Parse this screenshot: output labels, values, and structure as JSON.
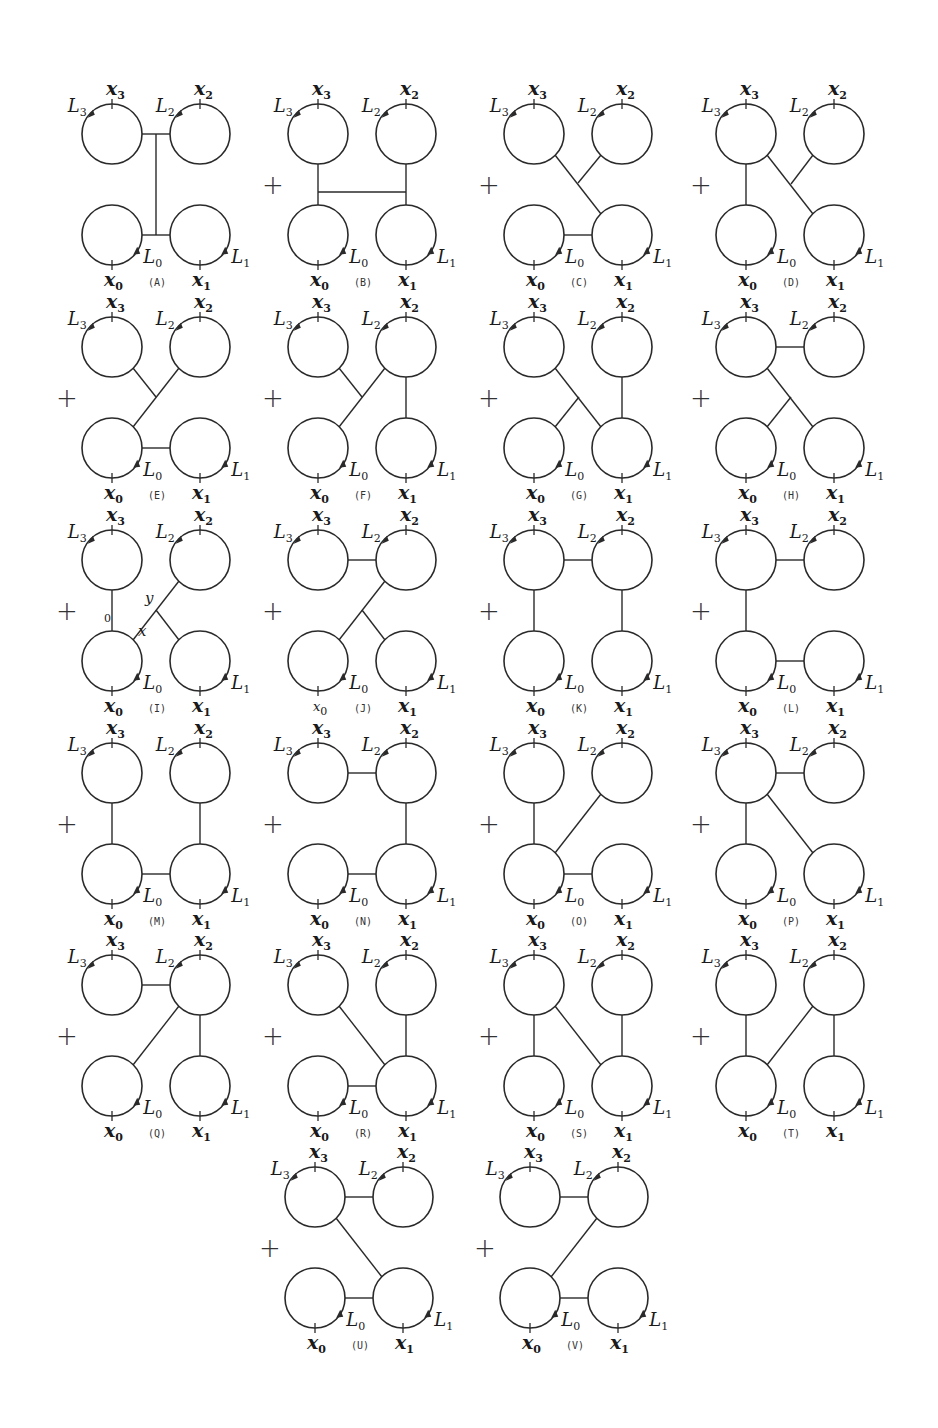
{
  "figure": {
    "circle_labels": {
      "top_left": {
        "point": "x",
        "point_sub": "3",
        "loop": "L",
        "loop_sub": "3"
      },
      "top_right": {
        "point": "x",
        "point_sub": "2",
        "loop": "L",
        "loop_sub": "2"
      },
      "bottom_left": {
        "point": "x",
        "point_sub": "0",
        "loop": "L",
        "loop_sub": "0"
      },
      "bottom_right": {
        "point": "x",
        "point_sub": "1",
        "loop": "L",
        "loop_sub": "1"
      }
    },
    "operator": "+",
    "geometry": {
      "radius": 30,
      "dx": 88,
      "dy": 101
    },
    "panels": [
      {
        "id": "(A)",
        "col": 0,
        "row": 0,
        "plus": false,
        "edges": [
          [
            [
              30,
              0
            ],
            [
              58,
              0
            ]
          ],
          [
            [
              30,
              101
            ],
            [
              58,
              101
            ]
          ],
          [
            [
              44,
              0
            ],
            [
              44,
              101
            ]
          ]
        ]
      },
      {
        "id": "(B)",
        "col": 1,
        "row": 0,
        "plus": true,
        "edges": [
          [
            [
              0,
              30
            ],
            [
              0,
              71
            ]
          ],
          [
            [
              88,
              30
            ],
            [
              88,
              71
            ]
          ],
          [
            [
              0,
              58
            ],
            [
              88,
              58
            ]
          ]
        ]
      },
      {
        "id": "(C)",
        "col": 2,
        "row": 0,
        "plus": true,
        "edges": [
          [
            [
              30,
              101
            ],
            [
              58,
              101
            ]
          ],
          [
            [
              21,
              21
            ],
            [
              67,
              80
            ]
          ],
          [
            [
              67,
              21
            ],
            [
              44,
              49
            ]
          ]
        ]
      },
      {
        "id": "(D)",
        "col": 3,
        "row": 0,
        "plus": true,
        "edges": [
          [
            [
              0,
              30
            ],
            [
              0,
              71
            ]
          ],
          [
            [
              21,
              21
            ],
            [
              67,
              80
            ]
          ],
          [
            [
              67,
              21
            ],
            [
              45,
              50
            ]
          ]
        ]
      },
      {
        "id": "(E)",
        "col": 0,
        "row": 1,
        "plus": true,
        "edges": [
          [
            [
              30,
              101
            ],
            [
              58,
              101
            ]
          ],
          [
            [
              21,
              80
            ],
            [
              67,
              21
            ]
          ],
          [
            [
              21,
              21
            ],
            [
              44,
              50
            ]
          ]
        ]
      },
      {
        "id": "(F)",
        "col": 1,
        "row": 1,
        "plus": true,
        "edges": [
          [
            [
              88,
              30
            ],
            [
              88,
              71
            ]
          ],
          [
            [
              21,
              80
            ],
            [
              67,
              21
            ]
          ],
          [
            [
              21,
              21
            ],
            [
              44,
              50
            ]
          ]
        ]
      },
      {
        "id": "(G)",
        "col": 2,
        "row": 1,
        "plus": true,
        "edges": [
          [
            [
              88,
              30
            ],
            [
              88,
              71
            ]
          ],
          [
            [
              21,
              21
            ],
            [
              67,
              80
            ]
          ],
          [
            [
              21,
              80
            ],
            [
              45,
              50
            ]
          ]
        ]
      },
      {
        "id": "(H)",
        "col": 3,
        "row": 1,
        "plus": true,
        "edges": [
          [
            [
              30,
              0
            ],
            [
              58,
              0
            ]
          ],
          [
            [
              21,
              21
            ],
            [
              67,
              80
            ]
          ],
          [
            [
              21,
              80
            ],
            [
              45,
              50
            ]
          ]
        ]
      },
      {
        "id": "(I)",
        "col": 0,
        "row": 2,
        "plus": true,
        "edges": [
          [
            [
              0,
              30
            ],
            [
              0,
              71
            ]
          ],
          [
            [
              21,
              80
            ],
            [
              67,
              21
            ]
          ],
          [
            [
              44,
              50
            ],
            [
              67,
              80
            ]
          ]
        ],
        "annotations": [
          {
            "text": "y",
            "x": 33,
            "y": 43
          },
          {
            "text": "x",
            "x": 26,
            "y": 76
          },
          {
            "text": "0",
            "x": -8,
            "y": 62,
            "small": true
          }
        ]
      },
      {
        "id": "(J)",
        "col": 1,
        "row": 2,
        "plus": true,
        "edges": [
          [
            [
              30,
              0
            ],
            [
              58,
              0
            ]
          ],
          [
            [
              21,
              80
            ],
            [
              67,
              21
            ]
          ],
          [
            [
              44,
              50
            ],
            [
              67,
              80
            ]
          ]
        ],
        "x0_small": true
      },
      {
        "id": "(K)",
        "col": 2,
        "row": 2,
        "plus": true,
        "edges": [
          [
            [
              30,
              0
            ],
            [
              58,
              0
            ]
          ],
          [
            [
              0,
              30
            ],
            [
              0,
              71
            ]
          ],
          [
            [
              88,
              30
            ],
            [
              88,
              71
            ]
          ]
        ]
      },
      {
        "id": "(L)",
        "col": 3,
        "row": 2,
        "plus": true,
        "edges": [
          [
            [
              30,
              0
            ],
            [
              58,
              0
            ]
          ],
          [
            [
              0,
              30
            ],
            [
              0,
              71
            ]
          ],
          [
            [
              30,
              101
            ],
            [
              58,
              101
            ]
          ]
        ]
      },
      {
        "id": "(M)",
        "col": 0,
        "row": 3,
        "plus": true,
        "edges": [
          [
            [
              0,
              30
            ],
            [
              0,
              71
            ]
          ],
          [
            [
              88,
              30
            ],
            [
              88,
              71
            ]
          ],
          [
            [
              30,
              101
            ],
            [
              58,
              101
            ]
          ]
        ]
      },
      {
        "id": "(N)",
        "col": 1,
        "row": 3,
        "plus": true,
        "edges": [
          [
            [
              30,
              0
            ],
            [
              58,
              0
            ]
          ],
          [
            [
              88,
              30
            ],
            [
              88,
              71
            ]
          ],
          [
            [
              30,
              101
            ],
            [
              58,
              101
            ]
          ]
        ]
      },
      {
        "id": "(O)",
        "col": 2,
        "row": 3,
        "plus": true,
        "edges": [
          [
            [
              0,
              30
            ],
            [
              0,
              71
            ]
          ],
          [
            [
              21,
              80
            ],
            [
              67,
              21
            ]
          ],
          [
            [
              30,
              101
            ],
            [
              58,
              101
            ]
          ]
        ]
      },
      {
        "id": "(P)",
        "col": 3,
        "row": 3,
        "plus": true,
        "edges": [
          [
            [
              30,
              0
            ],
            [
              58,
              0
            ]
          ],
          [
            [
              0,
              30
            ],
            [
              0,
              71
            ]
          ],
          [
            [
              21,
              21
            ],
            [
              67,
              80
            ]
          ]
        ]
      },
      {
        "id": "(Q)",
        "col": 0,
        "row": 4,
        "plus": true,
        "edges": [
          [
            [
              30,
              0
            ],
            [
              58,
              0
            ]
          ],
          [
            [
              21,
              80
            ],
            [
              67,
              21
            ]
          ],
          [
            [
              88,
              30
            ],
            [
              88,
              71
            ]
          ]
        ]
      },
      {
        "id": "(R)",
        "col": 1,
        "row": 4,
        "plus": true,
        "edges": [
          [
            [
              21,
              21
            ],
            [
              67,
              80
            ]
          ],
          [
            [
              88,
              30
            ],
            [
              88,
              71
            ]
          ],
          [
            [
              30,
              101
            ],
            [
              58,
              101
            ]
          ]
        ]
      },
      {
        "id": "(S)",
        "col": 2,
        "row": 4,
        "plus": true,
        "edges": [
          [
            [
              0,
              30
            ],
            [
              0,
              71
            ]
          ],
          [
            [
              21,
              21
            ],
            [
              67,
              80
            ]
          ],
          [
            [
              88,
              30
            ],
            [
              88,
              71
            ]
          ]
        ]
      },
      {
        "id": "(T)",
        "col": 3,
        "row": 4,
        "plus": true,
        "edges": [
          [
            [
              0,
              30
            ],
            [
              0,
              71
            ]
          ],
          [
            [
              21,
              80
            ],
            [
              67,
              21
            ]
          ],
          [
            [
              88,
              30
            ],
            [
              88,
              71
            ]
          ]
        ]
      },
      {
        "id": "(U)",
        "col": 1,
        "row": 5,
        "plus": true,
        "edges": [
          [
            [
              30,
              0
            ],
            [
              58,
              0
            ]
          ],
          [
            [
              21,
              21
            ],
            [
              67,
              80
            ]
          ],
          [
            [
              30,
              101
            ],
            [
              58,
              101
            ]
          ]
        ]
      },
      {
        "id": "(V)",
        "col": 2,
        "row": 5,
        "plus": true,
        "edges": [
          [
            [
              30,
              0
            ],
            [
              58,
              0
            ]
          ],
          [
            [
              21,
              80
            ],
            [
              67,
              21
            ]
          ],
          [
            [
              30,
              101
            ],
            [
              58,
              101
            ]
          ]
        ]
      }
    ],
    "layout": {
      "col_x": [
        112,
        318,
        534,
        746
      ],
      "row_y": [
        134,
        347,
        560,
        773,
        985,
        1197
      ],
      "last_row_col_x": [
        315,
        530
      ]
    }
  }
}
